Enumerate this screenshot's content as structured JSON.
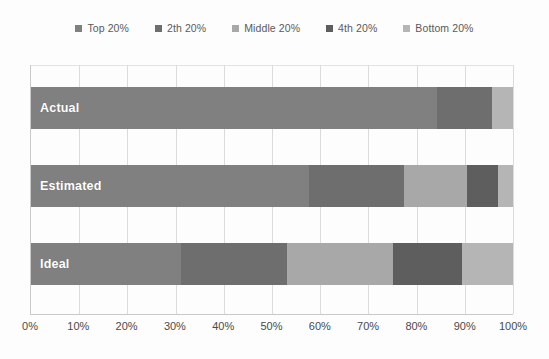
{
  "chart_data": {
    "type": "bar",
    "orientation": "horizontal",
    "stacked": true,
    "stack_mode": "percent",
    "title": "",
    "xlabel": "",
    "ylabel": "",
    "xlim": [
      0,
      100
    ],
    "grid": true,
    "legend_position": "top",
    "categories": [
      "Actual",
      "Estimated",
      "Ideal"
    ],
    "series": [
      {
        "name": "Top 20%",
        "color": "#808080",
        "values": [
          84.3,
          57.6,
          31.1
        ]
      },
      {
        "name": "2th 20%",
        "color": "#6e6e6e",
        "values": [
          11.4,
          19.8,
          22.1
        ]
      },
      {
        "name": "Middle 20%",
        "color": "#a8a8a8",
        "values": [
          0.0,
          13.1,
          22.0
        ]
      },
      {
        "name": "4th 20%",
        "color": "#5e5e5e",
        "values": [
          0.0,
          6.4,
          14.2
        ]
      },
      {
        "name": "Bottom 20%",
        "color": "#b5b5b5",
        "values": [
          4.3,
          3.1,
          10.6
        ]
      }
    ],
    "xticks": [
      {
        "value": 0,
        "label": "0%"
      },
      {
        "value": 10,
        "label": "10%"
      },
      {
        "value": 20,
        "label": "20%"
      },
      {
        "value": 30,
        "label": "30%"
      },
      {
        "value": 40,
        "label": "40%"
      },
      {
        "value": 50,
        "label": "50%"
      },
      {
        "value": 60,
        "label": "60%"
      },
      {
        "value": 70,
        "label": "70%"
      },
      {
        "value": 80,
        "label": "80%"
      },
      {
        "value": 90,
        "label": "90%"
      },
      {
        "value": 100,
        "label": "100%"
      }
    ]
  },
  "legend": {
    "items": [
      {
        "label": "Top 20%",
        "color": "#808080"
      },
      {
        "label": "2th 20%",
        "color": "#6e6e6e"
      },
      {
        "label": "Middle 20%",
        "color": "#a8a8a8"
      },
      {
        "label": "4th 20%",
        "color": "#5e5e5e"
      },
      {
        "label": "Bottom 20%",
        "color": "#b5b5b5"
      }
    ]
  },
  "bar_labels": {
    "actual": "Actual",
    "estimated": "Estimated",
    "ideal": "Ideal"
  }
}
